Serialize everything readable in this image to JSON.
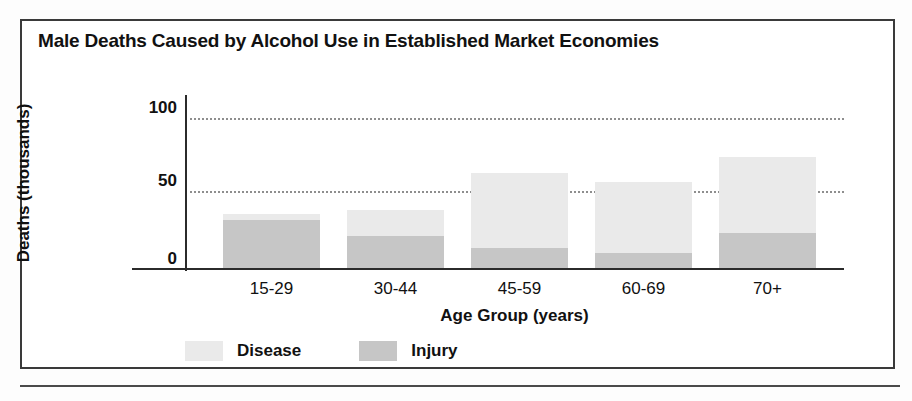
{
  "figure": {
    "title": "Male Deaths Caused by Alcohol Use in Established Market Economies"
  },
  "legend": {
    "position": "bottom-left",
    "items": [
      {
        "label": "Disease",
        "color": "#eaeaea"
      },
      {
        "label": "Injury",
        "color": "#c6c6c6"
      }
    ]
  },
  "axes": {
    "y_title": "Deaths (thousands)",
    "x_title": "Age Group (years)",
    "y_ticks": [
      "0",
      "50",
      "100"
    ]
  },
  "chart_data": {
    "type": "bar",
    "title": "Male Deaths Caused by Alcohol Use in Established Market Economies",
    "subtitle": "",
    "xlabel": "Age Group (years)",
    "ylabel": "Deaths (thousands)",
    "categories": [
      "15-29",
      "30-44",
      "45-59",
      "60-69",
      "70+"
    ],
    "stacked": true,
    "series": [
      {
        "name": "Injury",
        "color": "#c6c6c6",
        "values": [
          33,
          22,
          14,
          10,
          24
        ]
      },
      {
        "name": "Disease",
        "color": "#eaeaea",
        "values": [
          4,
          18,
          51,
          49,
          52
        ]
      }
    ],
    "totals": [
      37,
      40,
      65,
      59,
      76
    ],
    "ylim": [
      0,
      110
    ],
    "yticks": [
      0,
      50,
      100
    ],
    "grid": "horizontal-dotted",
    "legend_position": "bottom-left"
  }
}
